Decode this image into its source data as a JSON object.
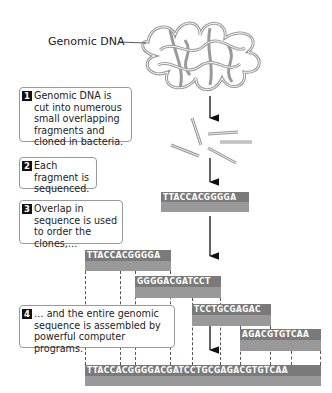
{
  "label": {
    "genomic_dna": "Genomic DNA"
  },
  "steps": [
    {
      "num": "1",
      "text": "Genomic DNA is cut into numerous small overlapping fragments and cloned in bacteria."
    },
    {
      "num": "2",
      "text": "Each fragment is sequenced."
    },
    {
      "num": "3",
      "text": "Overlap in sequence is used to order the clones,…"
    },
    {
      "num": "4",
      "text": "… and the entire genomic sequence is assembled by powerful computer programs."
    }
  ],
  "sequences": {
    "single_fragment": "TTACCACGGGGA",
    "clone_1": "TTACCACGGGGA",
    "clone_2": "GGGGACGATCCT",
    "clone_3": "TCCTGCGAGAC",
    "clone_4": "AGACGTGTCAA",
    "assembled": "TTACCACGGGGACGATCCTGCGAGACGTGTCAA"
  },
  "colors": {
    "bar_dark": "#7a7a7a",
    "bar_light": "#999999",
    "dna_strand": "#9a9a9a"
  }
}
